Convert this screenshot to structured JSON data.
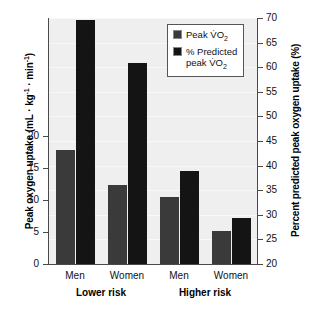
{
  "chart_data": {
    "type": "bar",
    "title": "",
    "categories": [
      "Men",
      "Women",
      "Men",
      "Women"
    ],
    "groups": [
      {
        "label": "Lower risk",
        "categories": [
          "Men",
          "Women"
        ]
      },
      {
        "label": "Higher risk",
        "categories": [
          "Men",
          "Women"
        ]
      }
    ],
    "series": [
      {
        "name": "Peak VO2",
        "name_display": "Peak V̇O",
        "name_sub": "2",
        "axis": "left",
        "color": "#3a3a3a",
        "values": [
          17.8,
          12.4,
          10.5,
          5.2
        ]
      },
      {
        "name": "% Predicted peak VO2",
        "name_display_line1": "% Predicted",
        "name_display_line2": "peak V̇O",
        "name_sub": "2",
        "axis": "right",
        "color": "#141414",
        "values": [
          69.5,
          60.8,
          39.0,
          29.4
        ]
      }
    ],
    "xlabel": "",
    "ylabel_left": "Peak oxygen uptake (mL · kg⁻¹ · min⁻¹)",
    "ylabel_right": "Percent predicted peak oxygen uptake (%)",
    "ylim_left": [
      0,
      38.5
    ],
    "ylim_right": [
      20,
      70
    ],
    "yticks_left": [
      0,
      5,
      10,
      15,
      20
    ],
    "ytick_labels_left": [
      "0",
      "5",
      "10",
      "15",
      "20"
    ],
    "yticks_right": [
      20,
      25,
      30,
      35,
      40,
      45,
      50,
      55,
      60,
      65,
      70
    ],
    "ytick_labels_right": [
      "20",
      "25",
      "30",
      "35",
      "40",
      "45",
      "50",
      "55",
      "60",
      "65",
      "70"
    ],
    "grid": true,
    "legend_position": "top-right",
    "plot_background": "#efefef",
    "figure_background": "#ffffff"
  },
  "axis_left": {
    "title_main": "Peak oxygen uptake (mL · kg",
    "title_sup1": "-1",
    "title_mid": " · min",
    "title_sup2": "-1",
    "title_end": ")"
  },
  "axis_right": {
    "title": "Percent predicted peak oxygen uptake (%)"
  },
  "legend": {
    "items": [
      {
        "label_line1": "Peak V̇O",
        "sub": "2",
        "label_line2": "",
        "color": "#3a3a3a"
      },
      {
        "label_line1": "% Predicted",
        "label_line2": "peak V̇O",
        "sub": "2",
        "color": "#141414"
      }
    ]
  }
}
